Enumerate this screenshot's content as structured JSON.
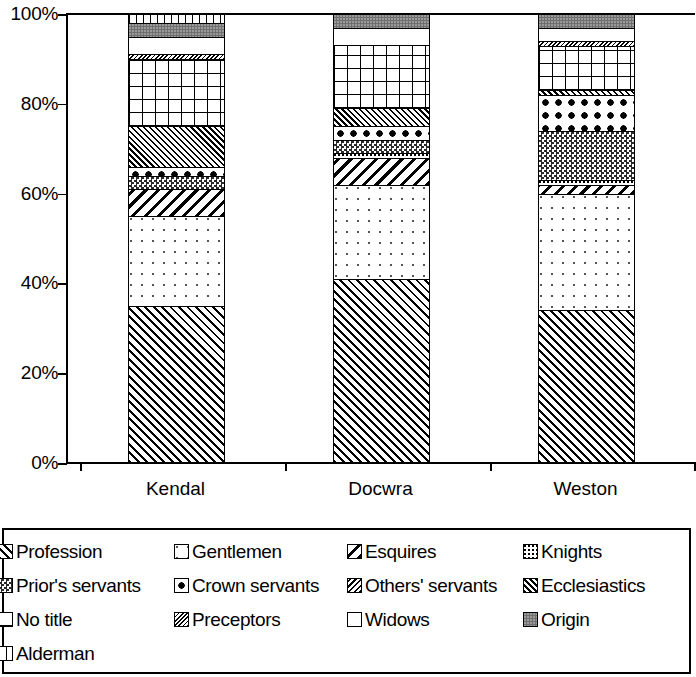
{
  "chart_data": {
    "type": "bar",
    "subtype": "stacked-100-percent",
    "title": "",
    "xlabel": "",
    "ylabel": "",
    "ylim": [
      0,
      100
    ],
    "ytick_labels": [
      "100%",
      "80%",
      "60%",
      "40%",
      "20%",
      "0%"
    ],
    "ytick_values": [
      100,
      80,
      60,
      40,
      20,
      0
    ],
    "grid": false,
    "legend_position": "bottom",
    "categories": [
      "Kendal",
      "Docwra",
      "Weston"
    ],
    "series": [
      {
        "name": "Profession",
        "pattern": "diagonal-hatch-up",
        "values": [
          35,
          41,
          34
        ]
      },
      {
        "name": "Gentlemen",
        "pattern": "sparse-dots",
        "values": [
          20,
          21,
          26
        ]
      },
      {
        "name": "Esquires",
        "pattern": "diagonal-hatch-down",
        "values": [
          6,
          6,
          2
        ]
      },
      {
        "name": "Knights",
        "pattern": "fine-dots",
        "values": [
          0,
          1,
          1
        ]
      },
      {
        "name": "Prior's servants",
        "pattern": "checkerboard",
        "values": [
          3,
          3,
          11
        ]
      },
      {
        "name": "Crown servants",
        "pattern": "large-diamonds",
        "values": [
          2,
          3,
          8
        ]
      },
      {
        "name": "Others' servants",
        "pattern": "fine-diagonal-down",
        "values": [
          0,
          0,
          0
        ]
      },
      {
        "name": "Ecclesiastics",
        "pattern": "dense-hatch-up",
        "values": [
          9,
          4,
          1
        ]
      },
      {
        "name": "No title",
        "pattern": "cross-grid",
        "values": [
          15,
          14,
          10
        ]
      },
      {
        "name": "Preceptors",
        "pattern": "fine-hatch-down",
        "values": [
          1,
          0,
          1
        ]
      },
      {
        "name": "Widows",
        "pattern": "solid-white",
        "values": [
          4,
          4,
          3
        ]
      },
      {
        "name": "Origin",
        "pattern": "solid-grey",
        "values": [
          3,
          3,
          3
        ]
      },
      {
        "name": "Alderman",
        "pattern": "vertical-stripes",
        "values": [
          2,
          0,
          0
        ]
      }
    ]
  },
  "axis": {
    "y_ticks": [
      {
        "label": "100%",
        "value": 100
      },
      {
        "label": "80%",
        "value": 80
      },
      {
        "label": "60%",
        "value": 60
      },
      {
        "label": "40%",
        "value": 40
      },
      {
        "label": "20%",
        "value": 20
      },
      {
        "label": "0%",
        "value": 0
      }
    ],
    "x_categories": [
      "Kendal",
      "Docwra",
      "Weston"
    ]
  },
  "legend": {
    "rows": [
      [
        {
          "label": "Profession",
          "pattern_class": "p-profession"
        },
        {
          "label": "Gentlemen",
          "pattern_class": "p-gentlemen"
        },
        {
          "label": "Esquires",
          "pattern_class": "p-esquires"
        },
        {
          "label": "Knights",
          "pattern_class": "p-knights"
        }
      ],
      [
        {
          "label": "Prior's servants",
          "pattern_class": "p-priors"
        },
        {
          "label": "Crown servants",
          "pattern_class": "p-crown"
        },
        {
          "label": "Others' servants",
          "pattern_class": "p-others"
        },
        {
          "label": "Ecclesiastics",
          "pattern_class": "p-eccles"
        }
      ],
      [
        {
          "label": "No title",
          "pattern_class": "p-notitle"
        },
        {
          "label": "Preceptors",
          "pattern_class": "p-preceptors"
        },
        {
          "label": "Widows",
          "pattern_class": "p-widows"
        },
        {
          "label": "Origin",
          "pattern_class": "p-origin"
        }
      ],
      [
        {
          "label": "Alderman",
          "pattern_class": "p-alderman"
        }
      ]
    ]
  },
  "colors": {
    "ink": "#000000",
    "origin_grey": "#6f6f6f",
    "background": "#ffffff"
  }
}
